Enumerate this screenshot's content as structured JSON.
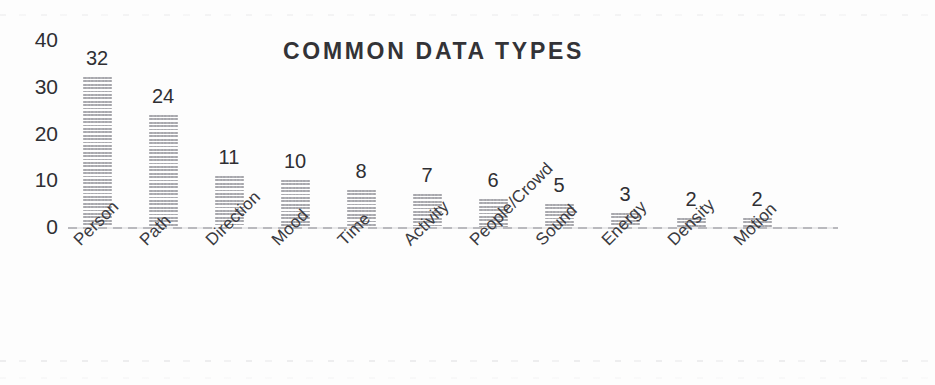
{
  "chart_data": {
    "type": "bar",
    "title": "COMMON DATA TYPES",
    "xlabel": "",
    "ylabel": "",
    "categories": [
      "Person",
      "Path",
      "Direction",
      "Mood",
      "Time",
      "Activity",
      "People/Crowd",
      "Sound",
      "Energy",
      "Density",
      "Motion"
    ],
    "values": [
      32,
      24,
      11,
      10,
      8,
      7,
      6,
      5,
      3,
      2,
      2
    ],
    "ylim": [
      0,
      40
    ],
    "yticks": [
      "0",
      "10",
      "20",
      "30",
      "40"
    ],
    "ytick_values": [
      0,
      10,
      20,
      30,
      40
    ],
    "grid": false,
    "legend": false,
    "data_labels_shown": true,
    "bar_color": "#9c9ca2",
    "bar_pattern": "horizontal-hatch",
    "title_color": "#333337",
    "axis_color": "#82828a",
    "label_rotation_degrees": -45
  }
}
